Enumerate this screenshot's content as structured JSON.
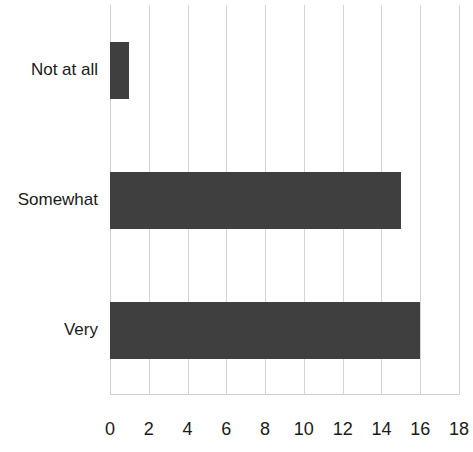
{
  "chart_data": {
    "type": "bar",
    "orientation": "horizontal",
    "title": "",
    "xlabel": "",
    "ylabel": "",
    "categories": [
      "Not at all",
      "Somewhat",
      "Very"
    ],
    "values": [
      1,
      15,
      16
    ],
    "series": [
      {
        "name": "Count",
        "values": [
          1,
          15,
          16
        ]
      }
    ],
    "xlim": [
      0,
      18
    ],
    "xticks": [
      0,
      2,
      4,
      6,
      8,
      10,
      12,
      14,
      16,
      18
    ],
    "xtick_labels": [
      "0",
      "2",
      "4",
      "6",
      "8",
      "10",
      "12",
      "14",
      "16",
      "18"
    ],
    "grid": "vertical",
    "legend": "none",
    "bar_color": "#3f3f3f",
    "gridline_color": "#d4d4d4",
    "background_color": "#ffffff"
  }
}
